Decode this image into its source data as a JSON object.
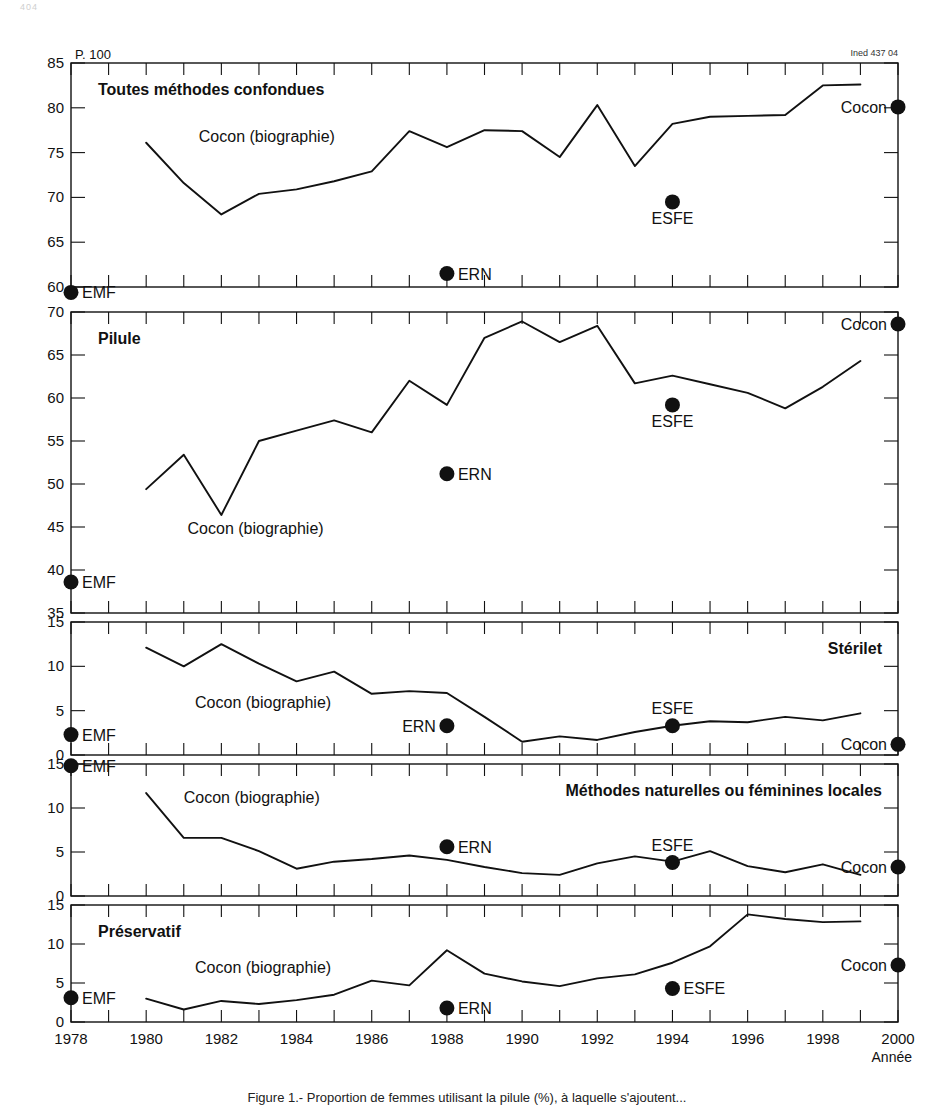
{
  "page": {
    "folio": "404",
    "corner_code": "Ined 437 04",
    "headnote": "P. 100",
    "caption": "Figure 1.- Proportion de femmes utilisant la pilule (%), à laquelle s'ajoutent..."
  },
  "axes": {
    "x": {
      "label": "Année",
      "min": 1978,
      "max": 2000,
      "tick_labels": [
        "1978",
        "1980",
        "1982",
        "1984",
        "1986",
        "1988",
        "1990",
        "1992",
        "1994",
        "1996",
        "1998",
        "2000"
      ],
      "tick_values": [
        1978,
        1980,
        1982,
        1984,
        1986,
        1988,
        1990,
        1992,
        1994,
        1996,
        1998,
        2000
      ],
      "minor_step": 1
    }
  },
  "legend": {
    "series_label": "Cocon (biographie)",
    "marker_emf": "EMF",
    "marker_ern": "ERN",
    "marker_esfe": "ESFE",
    "marker_cocon": "Cocon"
  },
  "chart_data": [
    {
      "type": "line",
      "title": "Toutes méthodes confondues",
      "title_align": "left",
      "xlabel": "",
      "ylabel": "",
      "ylim": [
        60,
        85
      ],
      "yticks": [
        60,
        65,
        70,
        75,
        80,
        85
      ],
      "grid": false,
      "series": [
        {
          "name": "Cocon (biographie)",
          "label_x": 1981.4,
          "label_y": 76.2,
          "x": [
            1980,
            1981,
            1982,
            1983,
            1984,
            1985,
            1986,
            1987,
            1988,
            1989,
            1990,
            1991,
            1992,
            1993,
            1994,
            1995,
            1996,
            1997,
            1998,
            1999
          ],
          "values": [
            76.1,
            71.6,
            68.1,
            70.4,
            70.9,
            71.8,
            72.9,
            77.4,
            75.6,
            77.5,
            77.4,
            74.5,
            80.3,
            73.5,
            78.2,
            79.0,
            79.1,
            79.2,
            82.5,
            82.6
          ]
        }
      ],
      "points": [
        {
          "name": "EMF",
          "x": 1978,
          "y": 59.4,
          "label": "EMF",
          "label_pos": "right"
        },
        {
          "name": "ERN",
          "x": 1988,
          "y": 61.5,
          "label": "ERN",
          "label_pos": "right"
        },
        {
          "name": "ESFE",
          "x": 1994,
          "y": 69.5,
          "label": "ESFE",
          "label_pos": "below"
        },
        {
          "name": "Cocon",
          "x": 2000,
          "y": 80.1,
          "label": "Cocon",
          "label_pos": "left"
        }
      ]
    },
    {
      "type": "line",
      "title": "Pilule",
      "title_align": "left",
      "xlabel": "",
      "ylabel": "",
      "ylim": [
        35,
        70
      ],
      "yticks": [
        35,
        40,
        45,
        50,
        55,
        60,
        65,
        70
      ],
      "grid": false,
      "series": [
        {
          "name": "Cocon (biographie)",
          "label_x": 1981.1,
          "label_y": 44.2,
          "x": [
            1980,
            1981,
            1982,
            1983,
            1984,
            1985,
            1986,
            1987,
            1988,
            1989,
            1990,
            1991,
            1992,
            1993,
            1994,
            1995,
            1996,
            1997,
            1998,
            1999
          ],
          "values": [
            49.4,
            53.4,
            46.4,
            55.0,
            56.2,
            57.4,
            56.0,
            62.0,
            59.2,
            67.0,
            68.9,
            66.5,
            68.4,
            61.7,
            62.6,
            61.6,
            60.6,
            58.8,
            61.3,
            64.3
          ]
        }
      ],
      "points": [
        {
          "name": "EMF",
          "x": 1978,
          "y": 38.6,
          "label": "EMF",
          "label_pos": "right"
        },
        {
          "name": "ERN",
          "x": 1988,
          "y": 51.2,
          "label": "ERN",
          "label_pos": "right"
        },
        {
          "name": "ESFE",
          "x": 1994,
          "y": 59.2,
          "label": "ESFE",
          "label_pos": "below"
        },
        {
          "name": "Cocon",
          "x": 2000,
          "y": 68.6,
          "label": "Cocon",
          "label_pos": "left"
        }
      ]
    },
    {
      "type": "line",
      "title": "Stérilet",
      "title_align": "right",
      "xlabel": "",
      "ylabel": "",
      "ylim": [
        0,
        15
      ],
      "yticks": [
        0,
        5,
        10,
        15
      ],
      "grid": false,
      "series": [
        {
          "name": "Cocon (biographie)",
          "label_x": 1981.3,
          "label_y": 5.3,
          "x": [
            1980,
            1981,
            1982,
            1983,
            1984,
            1985,
            1986,
            1987,
            1988,
            1989,
            1990,
            1991,
            1992,
            1993,
            1994,
            1995,
            1996,
            1997,
            1998,
            1999
          ],
          "values": [
            12.1,
            10.0,
            12.5,
            10.3,
            8.3,
            9.4,
            6.9,
            7.2,
            7.0,
            4.3,
            1.5,
            2.1,
            1.7,
            2.6,
            3.3,
            3.8,
            3.7,
            4.3,
            3.9,
            4.7
          ]
        }
      ],
      "points": [
        {
          "name": "EMF",
          "x": 1978,
          "y": 2.3,
          "label": "EMF",
          "label_pos": "right"
        },
        {
          "name": "ERN",
          "x": 1988,
          "y": 3.3,
          "label": "ERN",
          "label_pos": "left"
        },
        {
          "name": "ESFE",
          "x": 1994,
          "y": 3.3,
          "label": "ESFE",
          "label_pos": "above"
        },
        {
          "name": "Cocon",
          "x": 2000,
          "y": 1.2,
          "label": "Cocon",
          "label_pos": "left"
        }
      ]
    },
    {
      "type": "line",
      "title": "Méthodes naturelles ou féminines locales",
      "title_align": "right",
      "xlabel": "",
      "ylabel": "",
      "ylim": [
        0,
        15
      ],
      "yticks": [
        0,
        5,
        10,
        15
      ],
      "grid": false,
      "series": [
        {
          "name": "Cocon (biographie)",
          "label_x": 1981.0,
          "label_y": 10.6,
          "x": [
            1980,
            1981,
            1982,
            1983,
            1984,
            1985,
            1986,
            1987,
            1988,
            1989,
            1990,
            1991,
            1992,
            1993,
            1994,
            1995,
            1996,
            1997,
            1998,
            1999
          ],
          "values": [
            11.7,
            6.6,
            6.6,
            5.1,
            3.1,
            3.9,
            4.2,
            4.6,
            4.1,
            3.3,
            2.6,
            2.4,
            3.7,
            4.5,
            3.9,
            5.1,
            3.4,
            2.7,
            3.6,
            2.4
          ]
        }
      ],
      "points": [
        {
          "name": "EMF",
          "x": 1978,
          "y": 14.8,
          "label": "EMF",
          "label_pos": "right"
        },
        {
          "name": "ERN",
          "x": 1988,
          "y": 5.6,
          "label": "ERN",
          "label_pos": "right"
        },
        {
          "name": "ESFE",
          "x": 1994,
          "y": 3.8,
          "label": "ESFE",
          "label_pos": "above"
        },
        {
          "name": "Cocon",
          "x": 2000,
          "y": 3.3,
          "label": "Cocon",
          "label_pos": "left"
        }
      ]
    },
    {
      "type": "line",
      "title": "Préservatif",
      "title_align": "left",
      "xlabel": "",
      "ylabel": "",
      "ylim": [
        0,
        15
      ],
      "yticks": [
        0,
        5,
        10,
        15
      ],
      "grid": false,
      "series": [
        {
          "name": "Cocon (biographie)",
          "label_x": 1981.3,
          "label_y": 6.3,
          "x": [
            1980,
            1981,
            1982,
            1983,
            1984,
            1985,
            1986,
            1987,
            1988,
            1989,
            1990,
            1991,
            1992,
            1993,
            1994,
            1995,
            1996,
            1997,
            1998,
            1999
          ],
          "values": [
            3.0,
            1.6,
            2.7,
            2.3,
            2.8,
            3.5,
            5.3,
            4.7,
            9.2,
            6.2,
            5.2,
            4.6,
            5.6,
            6.1,
            7.6,
            9.7,
            13.8,
            13.2,
            12.8,
            12.9
          ]
        }
      ],
      "points": [
        {
          "name": "EMF",
          "x": 1978,
          "y": 3.1,
          "label": "EMF",
          "label_pos": "right"
        },
        {
          "name": "ERN",
          "x": 1988,
          "y": 1.8,
          "label": "ERN",
          "label_pos": "right"
        },
        {
          "name": "ESFE",
          "x": 1994,
          "y": 4.3,
          "label": "ESFE",
          "label_pos": "right"
        },
        {
          "name": "Cocon",
          "x": 2000,
          "y": 7.3,
          "label": "Cocon",
          "label_pos": "left"
        }
      ]
    }
  ]
}
